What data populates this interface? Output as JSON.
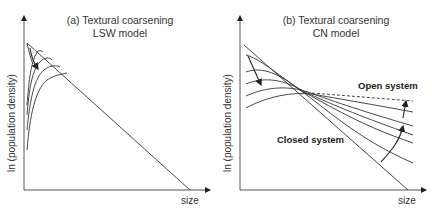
{
  "panels": [
    {
      "id": "a",
      "title_line1": "(a) Textural coarsening",
      "title_line2": "LSW model",
      "ylabel": "ln (population density)",
      "xlabel": "size"
    },
    {
      "id": "b",
      "title_line1": "(b) Textural coarsening",
      "title_line2": "CN model",
      "ylabel": "ln (population density)",
      "xlabel": "size",
      "annotations": {
        "open": "Open system",
        "closed": "Closed system"
      }
    }
  ],
  "colors": {
    "line": "#333333",
    "axis": "#555555"
  }
}
